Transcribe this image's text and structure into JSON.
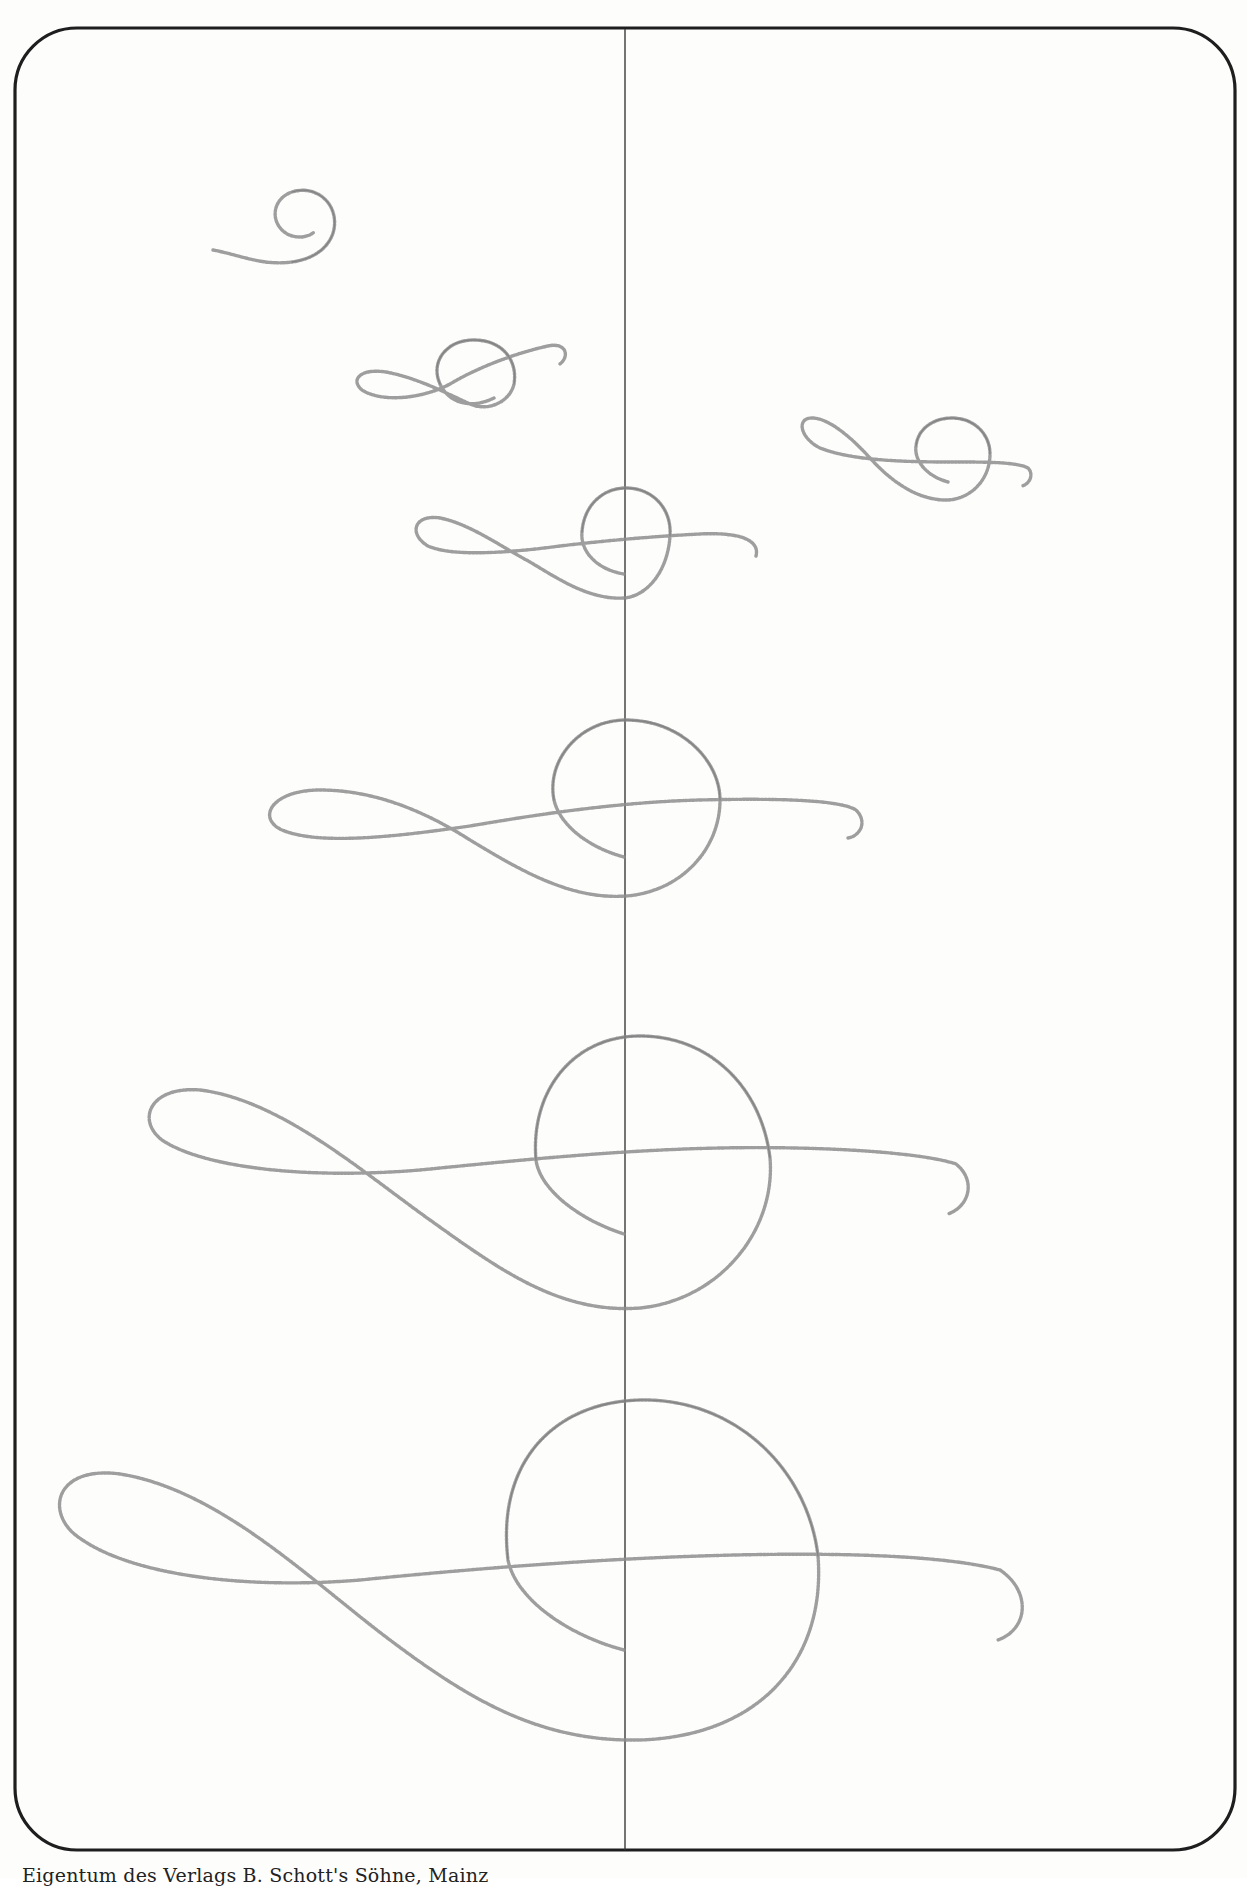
{
  "page": {
    "background": "#fdfdfc",
    "frame_color": "#1e1e1e",
    "pencil_color": "#8d8d8d"
  },
  "figure": {
    "frame": {
      "shape": "rounded-rectangle",
      "left": 14,
      "top": 27,
      "right": 1235,
      "bottom": 1850,
      "corner_radius": 62
    },
    "center_guide_line": {
      "x": 625,
      "y_start": 28,
      "y_end": 1851
    },
    "stages": [
      {
        "id": 1,
        "label": "spiral start",
        "center": [
          305,
          222
        ],
        "radius": 30
      },
      {
        "id": 2,
        "label": "small clef",
        "circle_center": [
          478,
          372
        ],
        "rx": 38,
        "ry": 30
      },
      {
        "id": 3,
        "label": "clef on guide line",
        "circle_center": [
          624,
          542
        ],
        "rx": 45,
        "ry": 55
      },
      {
        "id": 4,
        "label": "medium clef",
        "circle_center": [
          630,
          800
        ],
        "rx": 92,
        "ry": 90
      },
      {
        "id": 5,
        "label": "large clef",
        "circle_center": [
          648,
          1160
        ],
        "rx": 128,
        "ry": 138
      },
      {
        "id": 6,
        "label": "largest clef",
        "circle_center": [
          655,
          1556
        ],
        "rx": 165,
        "ry": 195
      },
      {
        "id": 7,
        "label": "right-side small clef",
        "circle_center": [
          950,
          460
        ],
        "rx": 55,
        "ry": 42
      }
    ]
  },
  "caption": {
    "text": "Eigentum des Verlags B. Schott's Söhne, Mainz"
  }
}
